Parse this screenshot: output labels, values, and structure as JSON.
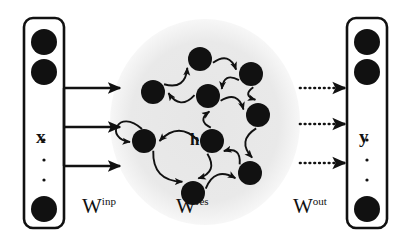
{
  "figure": {
    "type": "echo-state-network-diagram",
    "background_color": "#ffffff",
    "ink_color": "#111111",
    "reservoir_fill": "#e8e8e8"
  },
  "input_layer": {
    "name": "input-vector",
    "label": "x",
    "box": {
      "x": 24,
      "y": 18,
      "width": 40,
      "height": 210,
      "radius": 9
    },
    "nodes": [
      {
        "cx": 44,
        "cy": 42,
        "r": 13
      },
      {
        "cx": 44,
        "cy": 72,
        "r": 13
      },
      {
        "cx": 44,
        "cy": 209,
        "r": 13
      }
    ],
    "ellipsis_dots": [
      {
        "cx": 44,
        "cy": 140,
        "r": 1.6
      },
      {
        "cx": 44,
        "cy": 160,
        "r": 1.6
      },
      {
        "cx": 44,
        "cy": 180,
        "r": 1.6
      }
    ],
    "label_pos": {
      "x": 36,
      "y": 127
    }
  },
  "input_weights": {
    "name": "input-weight-matrix",
    "label": "W",
    "superscript": "inp",
    "label_pos": {
      "x": 82,
      "y": 196
    },
    "style": "solid",
    "arrows": [
      {
        "x1": 64,
        "y1": 88,
        "x2": 120,
        "y2": 88
      },
      {
        "x1": 64,
        "y1": 127,
        "x2": 120,
        "y2": 127
      },
      {
        "x1": 64,
        "y1": 166,
        "x2": 120,
        "y2": 166
      }
    ],
    "bus": {
      "x": 64,
      "y1": 88,
      "y2": 166
    }
  },
  "reservoir": {
    "name": "reservoir",
    "label": "h",
    "label_pos": {
      "x": 190,
      "y": 131
    },
    "matrix_label": "W",
    "matrix_superscript": "res",
    "matrix_label_pos": {
      "x": 176,
      "y": 196
    },
    "circle": {
      "cx": 205,
      "cy": 122,
      "rx": 95,
      "ry": 103
    },
    "node_radius": 12,
    "nodes": [
      {
        "id": "n1",
        "cx": 200,
        "cy": 59
      },
      {
        "id": "n2",
        "cx": 251,
        "cy": 74
      },
      {
        "id": "n3",
        "cx": 153,
        "cy": 92
      },
      {
        "id": "n4",
        "cx": 208,
        "cy": 96
      },
      {
        "id": "n5",
        "cx": 258,
        "cy": 115
      },
      {
        "id": "n6",
        "cx": 144,
        "cy": 141
      },
      {
        "id": "n7",
        "cx": 212,
        "cy": 141
      },
      {
        "id": "n8",
        "cx": 250,
        "cy": 173
      },
      {
        "id": "n9",
        "cx": 193,
        "cy": 193
      }
    ],
    "connections": [
      {
        "from": "n3",
        "to": "n1"
      },
      {
        "from": "n1",
        "to": "n2"
      },
      {
        "from": "n2",
        "to": "n4"
      },
      {
        "from": "n4",
        "to": "n3"
      },
      {
        "from": "n2",
        "to": "n5"
      },
      {
        "from": "n4",
        "to": "n5"
      },
      {
        "from": "n5",
        "to": "n8"
      },
      {
        "from": "n7",
        "to": "n4"
      },
      {
        "from": "n7",
        "to": "n6"
      },
      {
        "from": "n6",
        "to": "n6"
      },
      {
        "from": "n6",
        "to": "n9"
      },
      {
        "from": "n9",
        "to": "n8"
      },
      {
        "from": "n8",
        "to": "n7"
      },
      {
        "from": "n7",
        "to": "n9"
      }
    ]
  },
  "output_weights": {
    "name": "output-weight-matrix",
    "label": "W",
    "superscript": "out",
    "label_pos": {
      "x": 293,
      "y": 196
    },
    "style": "dotted",
    "arrows": [
      {
        "x1": 300,
        "y1": 88,
        "x2": 345,
        "y2": 88
      },
      {
        "x1": 300,
        "y1": 124,
        "x2": 345,
        "y2": 124
      },
      {
        "x1": 300,
        "y1": 163,
        "x2": 345,
        "y2": 163
      }
    ]
  },
  "output_layer": {
    "name": "output-vector",
    "label": "y",
    "box": {
      "x": 347,
      "y": 18,
      "width": 40,
      "height": 210,
      "radius": 9
    },
    "nodes": [
      {
        "cx": 367,
        "cy": 42,
        "r": 13
      },
      {
        "cx": 367,
        "cy": 72,
        "r": 13
      },
      {
        "cx": 367,
        "cy": 209,
        "r": 13
      }
    ],
    "ellipsis_dots": [
      {
        "cx": 367,
        "cy": 140,
        "r": 1.6
      },
      {
        "cx": 367,
        "cy": 160,
        "r": 1.6
      },
      {
        "cx": 367,
        "cy": 180,
        "r": 1.6
      }
    ],
    "label_pos": {
      "x": 359,
      "y": 127
    }
  }
}
